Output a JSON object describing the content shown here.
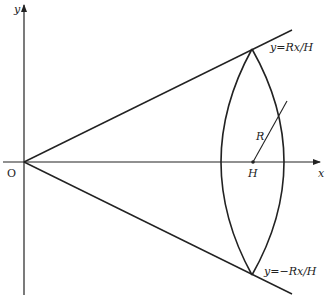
{
  "diagram": {
    "type": "geometry-cone-cross-section",
    "stroke_color": "#222222",
    "background": "#ffffff",
    "axes": {
      "x_label": "x",
      "y_label": "y",
      "origin_label": "O"
    },
    "lines": {
      "upper_line_label": "y=Rx/H",
      "lower_line_label": "y=−Rx/H"
    },
    "labels": {
      "radius_label": "R",
      "height_label": "H"
    }
  }
}
